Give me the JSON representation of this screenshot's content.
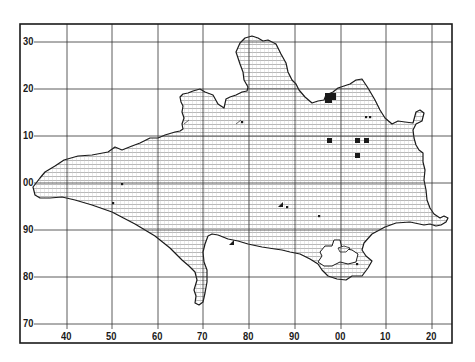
{
  "map": {
    "title": "",
    "grid": {
      "x_labels": [
        "40",
        "50",
        "60",
        "70",
        "80",
        "90",
        "00",
        "10",
        "20"
      ],
      "x_positions": [
        67,
        112,
        158,
        203,
        249,
        295,
        341,
        386,
        432
      ],
      "y_labels": [
        "30",
        "20",
        "10",
        "00",
        "90",
        "80",
        "70"
      ],
      "y_positions": [
        42,
        89,
        136,
        183,
        230,
        277,
        324
      ]
    },
    "frame": {
      "left": 20,
      "top": 24,
      "right": 452,
      "bottom": 343
    },
    "colors": {
      "ink": "#1a1a1a",
      "grid": "#333333",
      "hatch": "#9a9a9a",
      "paper": "#ffffff"
    },
    "symbols": {
      "squares": [
        {
          "x": 325,
          "y": 93,
          "s": 7
        },
        {
          "x": 329,
          "y": 93,
          "s": 7
        },
        {
          "x": 325,
          "y": 96,
          "s": 7
        },
        {
          "x": 327,
          "y": 138,
          "s": 5
        },
        {
          "x": 355,
          "y": 138,
          "s": 5
        },
        {
          "x": 364,
          "y": 138,
          "s": 5
        },
        {
          "x": 355,
          "y": 153,
          "s": 5
        }
      ],
      "triangles": [
        {
          "x": 229,
          "y": 241
        },
        {
          "x": 278,
          "y": 203
        }
      ],
      "dots": [
        {
          "x": 122,
          "y": 184
        },
        {
          "x": 113,
          "y": 203
        },
        {
          "x": 287,
          "y": 207
        },
        {
          "x": 242,
          "y": 122
        },
        {
          "x": 366,
          "y": 117
        },
        {
          "x": 370,
          "y": 117
        },
        {
          "x": 319,
          "y": 216
        },
        {
          "x": 357,
          "y": 264
        }
      ],
      "slashes": [
        {
          "x": 186,
          "y": 122
        },
        {
          "x": 238,
          "y": 122
        }
      ]
    }
  }
}
